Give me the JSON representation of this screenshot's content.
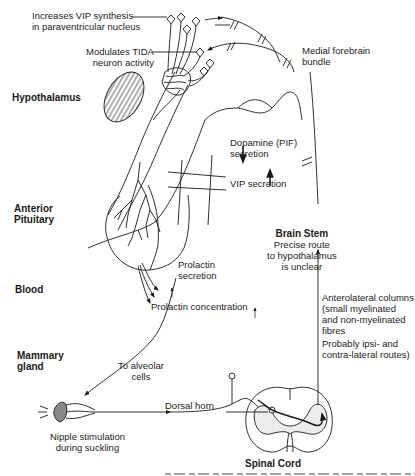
{
  "regions": {
    "hypothalamus": "Hypothalamus",
    "anterior_pituitary": [
      "Anterior",
      "Pituitary"
    ],
    "blood": "Blood",
    "mammary_gland": [
      "Mammary",
      "gland"
    ],
    "brain_stem": "Brain Stem",
    "spinal_cord": "Spinal Cord"
  },
  "labels": {
    "vip_synthesis": [
      "Increases VIP synthesis",
      "in paraventricular nucleus"
    ],
    "tida": [
      "Modulates TIDA",
      "neuron activity"
    ],
    "mfb": [
      "Medial forebrain",
      "bundle"
    ],
    "dopamine": [
      "Dopamine (PIF)",
      "secretion"
    ],
    "dopamine_arrow": "down",
    "vip_secretion": "VIP secretion",
    "vip_secretion_arrow": "up",
    "brain_stem_note": [
      "Precise route",
      "to hypothalamus",
      "is unclear"
    ],
    "prolactin_secretion": [
      "Prolactin",
      "secretion"
    ],
    "prolactin_secretion_arrow": "up",
    "prolactin_concentration": "Prolactin concentration",
    "prolactin_concentration_arrow": "up",
    "anterolateral": [
      "Anterolateral columns",
      "(small myelinated",
      "and non-myelinated",
      "fibres"
    ],
    "routes": [
      "Probably ipsi- and",
      "contra-lateral routes)"
    ],
    "alveolar": [
      "To alveolar",
      "cells"
    ],
    "dorsal_horn": "Dorsal horn",
    "nipple": [
      "Nipple stimulation",
      "during suckling"
    ]
  },
  "colors": {
    "line": "#1a1a1a",
    "shade": "#e6e6e6",
    "background": "#ffffff"
  }
}
